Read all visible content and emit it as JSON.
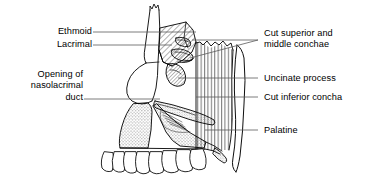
{
  "figure": {
    "background_color": "#ffffff",
    "line_color": "#000000",
    "leader_color": "#4a4a4a"
  },
  "labels": {
    "ethmoid": "Ethmoid",
    "lacrimal": "Lacrimal",
    "opening_nasolacrimal_line1": "Opening of",
    "opening_nasolacrimal_line2": "nasolacrimal",
    "opening_nasolacrimal_line3": "duct",
    "cut_conchae_line1": "Cut superior and",
    "cut_conchae_line2": "middle conchae",
    "uncinate_process": "Uncinate process",
    "cut_inferior_concha": "Cut inferior concha",
    "palatine": "Palatine"
  },
  "structures": [
    {
      "name": "nasal-bone",
      "fill": "none",
      "texture": "plain"
    },
    {
      "name": "frontal-process-maxilla",
      "fill": "none",
      "texture": "plain"
    },
    {
      "name": "ethmoid-bone",
      "fill": "hatch-diagonal",
      "texture": "diagonal-hatch"
    },
    {
      "name": "lacrimal-bone",
      "fill": "hatch-diagonal",
      "texture": "diagonal-hatch"
    },
    {
      "name": "superior-concha-cut",
      "fill": "hatch-diagonal",
      "texture": "diagonal-hatch"
    },
    {
      "name": "middle-concha-cut",
      "fill": "hatch-diagonal",
      "texture": "diagonal-hatch"
    },
    {
      "name": "uncinate-process",
      "fill": "hatch-diagonal",
      "texture": "diagonal-hatch"
    },
    {
      "name": "sphenoid-pterygoid",
      "fill": "hatch-vertical",
      "texture": "vertical-hatch"
    },
    {
      "name": "palatine-bone",
      "fill": "hatch-vertical",
      "texture": "vertical-hatch"
    },
    {
      "name": "maxilla",
      "fill": "stipple",
      "texture": "stipple"
    },
    {
      "name": "hard-palate",
      "fill": "stipple",
      "texture": "stipple"
    },
    {
      "name": "inferior-concha-cut",
      "fill": "stipple",
      "texture": "stipple"
    },
    {
      "name": "upper-teeth",
      "fill": "none",
      "texture": "plain",
      "count": 8
    }
  ]
}
